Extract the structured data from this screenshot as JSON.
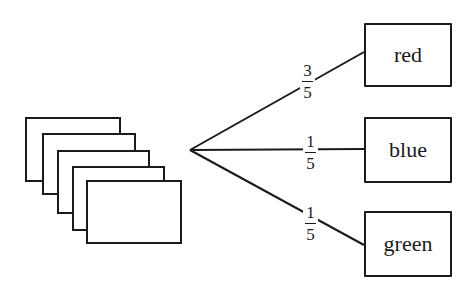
{
  "diagram": {
    "type": "tree-diagram",
    "root": {
      "label": "",
      "icon": "card-stack-icon",
      "card_count": 5
    },
    "branches": [
      {
        "probability": {
          "numerator": "3",
          "denominator": "5"
        },
        "outcome": "red"
      },
      {
        "probability": {
          "numerator": "1",
          "denominator": "5"
        },
        "outcome": "blue"
      },
      {
        "probability": {
          "numerator": "1",
          "denominator": "5"
        },
        "outcome": "green"
      }
    ],
    "colors": {
      "stroke": "#1a1a1a",
      "background": "#ffffff"
    }
  }
}
